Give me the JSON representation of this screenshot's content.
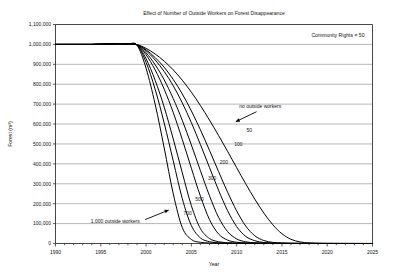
{
  "chart_data": {
    "type": "line",
    "title": "Effect of Number of Outside Workers on Forest Disappearance",
    "xlabel": "Year",
    "ylabel": "Forest (m³)",
    "annotation": "Community Rights = 50",
    "xlim": [
      1990,
      2025
    ],
    "ylim": [
      0,
      1100000
    ],
    "xticks": [
      1990,
      1995,
      2000,
      2005,
      2010,
      2015,
      2020,
      2025
    ],
    "xticklabels": [
      "1990",
      "1995",
      "2000",
      "2005",
      "2010",
      "2015",
      "2020",
      "2025"
    ],
    "xminor_step": 1,
    "yticks": [
      0,
      100000,
      200000,
      300000,
      400000,
      500000,
      600000,
      700000,
      800000,
      900000,
      1000000,
      1100000
    ],
    "yticklabels": [
      "0",
      "100,000",
      "200,000",
      "300,000",
      "400,000",
      "500,000",
      "600,000",
      "700,000",
      "800,000",
      "900,000",
      "1,000,000",
      "1,100,000"
    ],
    "grid": "horizontal",
    "legend": "none",
    "x": [
      1990,
      1991,
      1992,
      1993,
      1994,
      1995,
      1996,
      1997,
      1998,
      1999,
      2000,
      2001,
      2002,
      2003,
      2004,
      2005,
      2006,
      2007,
      2008,
      2009,
      2010,
      2011,
      2012,
      2013,
      2014,
      2015,
      2016,
      2017,
      2018,
      2019,
      2020,
      2021,
      2022,
      2023,
      2024,
      2025
    ],
    "series": [
      {
        "name": "1,000 outside workers",
        "label": "1,000 outside workers",
        "label_x": 1996.6,
        "label_y": 105000,
        "arrow": {
          "x1": 1999.9,
          "y1": 120000,
          "x2": 2002.5,
          "y2": 168000
        },
        "values": [
          1000000,
          1000000,
          1000000,
          1000000,
          1000000,
          1001000,
          1002000,
          1003000,
          1002000,
          996000,
          880000,
          700000,
          480000,
          250000,
          80000,
          20000,
          6000,
          2500,
          1200,
          700,
          450,
          300,
          200,
          150,
          110,
          90,
          70,
          55,
          45,
          38,
          32,
          27,
          23,
          20,
          17,
          15
        ]
      },
      {
        "name": "700",
        "label": "700",
        "label_x": 2004.6,
        "label_y": 145000,
        "values": [
          1000000,
          1000000,
          1000000,
          1000000,
          1000000,
          1001000,
          1002000,
          1003000,
          1002000,
          997000,
          910000,
          775000,
          605000,
          415000,
          225000,
          90000,
          28000,
          9000,
          3500,
          1700,
          950,
          600,
          400,
          280,
          200,
          150,
          115,
          90,
          72,
          58,
          48,
          40,
          33,
          28,
          24,
          20
        ]
      },
      {
        "name": "500",
        "label": "500",
        "label_x": 2005.9,
        "label_y": 215000,
        "values": [
          1000000,
          1000000,
          1000000,
          1000000,
          1000000,
          1001000,
          1002000,
          1003000,
          1002000,
          997500,
          928000,
          820000,
          685000,
          525000,
          355000,
          190000,
          75000,
          25000,
          9000,
          3800,
          1900,
          1100,
          700,
          470,
          330,
          240,
          180,
          140,
          110,
          88,
          72,
          60,
          50,
          42,
          36,
          30
        ]
      },
      {
        "name": "300",
        "label": "300",
        "label_x": 2007.3,
        "label_y": 320000,
        "values": [
          1000000,
          1000000,
          1000000,
          1000000,
          1000000,
          1001000,
          1002000,
          1003000,
          1002000,
          998000,
          948000,
          872000,
          775000,
          658000,
          522000,
          378000,
          238000,
          120000,
          48000,
          17000,
          6500,
          2900,
          1500,
          900,
          580,
          400,
          290,
          215,
          165,
          130,
          104,
          85,
          70,
          59,
          50,
          43
        ]
      },
      {
        "name": "200",
        "label": "200",
        "label_x": 2008.6,
        "label_y": 400000,
        "values": [
          1000000,
          1000000,
          1000000,
          1000000,
          1000000,
          1001000,
          1002000,
          1003000,
          1002000,
          998200,
          958000,
          898000,
          822000,
          728000,
          618000,
          495000,
          366000,
          240000,
          132000,
          60000,
          23000,
          8500,
          3600,
          1800,
          1000,
          630,
          430,
          310,
          230,
          178,
          140,
          113,
          93,
          77,
          65,
          55
        ]
      },
      {
        "name": "100",
        "label": "100",
        "label_x": 2010.2,
        "label_y": 490000,
        "values": [
          1000000,
          1000000,
          1000000,
          1000000,
          1000000,
          1001000,
          1002000,
          1003000,
          1002000,
          998500,
          968000,
          922000,
          864000,
          792000,
          706000,
          607000,
          497000,
          382000,
          268000,
          165000,
          85000,
          36000,
          14000,
          5200,
          2200,
          1100,
          650,
          430,
          305,
          228,
          176,
          140,
          114,
          94,
          79,
          67
        ]
      },
      {
        "name": "50",
        "label": "50",
        "label_x": 2011.4,
        "label_y": 562000,
        "values": [
          1000000,
          1000000,
          1000000,
          1000000,
          1000000,
          1001000,
          1002000,
          1003000,
          1002000,
          998700,
          973000,
          934000,
          885000,
          824000,
          751000,
          666000,
          571000,
          468000,
          362000,
          258000,
          164000,
          88000,
          39000,
          15000,
          5600,
          2300,
          1100,
          660,
          440,
          318,
          240,
          187,
          150,
          123,
          102,
          86
        ]
      },
      {
        "name": "no outside workers",
        "label": "no outside workers",
        "label_x": 2012.6,
        "label_y": 680000,
        "arrow": {
          "x1": 2012.2,
          "y1": 662000,
          "x2": 2009.9,
          "y2": 612000
        },
        "values": [
          1000000,
          1000000,
          1000000,
          1000000,
          1000000,
          1001000,
          1002000,
          1003000,
          1002000,
          999000,
          980000,
          952000,
          916000,
          872000,
          820000,
          760000,
          693000,
          620000,
          543000,
          463000,
          381000,
          300000,
          223000,
          153000,
          94000,
          49000,
          21000,
          8000,
          3000,
          1300,
          700,
          430,
          290,
          210,
          160,
          125
        ]
      }
    ]
  }
}
